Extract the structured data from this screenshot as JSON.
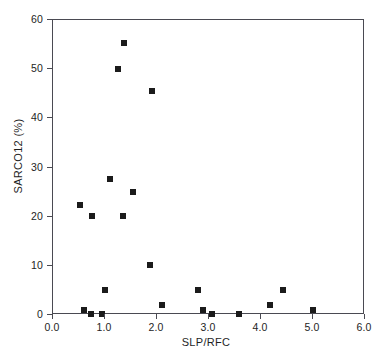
{
  "chart_data": {
    "type": "scatter",
    "title": "",
    "xlabel": "SLP/RFC",
    "ylabel": "SARCO12 (%)",
    "xlim": [
      0.0,
      6.0
    ],
    "ylim": [
      0,
      60
    ],
    "grid": false,
    "legend": null,
    "marker": {
      "shape": "square",
      "color": "#1b1b1b",
      "size_px": 6
    },
    "xticks": [
      "0.0",
      "1.0",
      "2.0",
      "3.0",
      "4.0",
      "5.0",
      "6.0"
    ],
    "xtick_values": [
      0.0,
      1.0,
      2.0,
      3.0,
      4.0,
      5.0,
      6.0
    ],
    "yticks": [
      "0",
      "10",
      "20",
      "30",
      "40",
      "50",
      "60"
    ],
    "ytick_values": [
      0,
      10,
      20,
      30,
      40,
      50,
      60
    ],
    "points": [
      {
        "x": 1.37,
        "y": 55.3
      },
      {
        "x": 1.25,
        "y": 50.0
      },
      {
        "x": 1.9,
        "y": 45.6
      },
      {
        "x": 1.1,
        "y": 27.6
      },
      {
        "x": 1.54,
        "y": 25.1
      },
      {
        "x": 0.52,
        "y": 22.4
      },
      {
        "x": 0.75,
        "y": 20.1
      },
      {
        "x": 1.35,
        "y": 20.1
      },
      {
        "x": 1.87,
        "y": 10.1
      },
      {
        "x": 1.0,
        "y": 5.0
      },
      {
        "x": 2.79,
        "y": 5.0
      },
      {
        "x": 4.42,
        "y": 5.0
      },
      {
        "x": 2.1,
        "y": 2.0
      },
      {
        "x": 4.17,
        "y": 2.0
      },
      {
        "x": 0.6,
        "y": 1.0
      },
      {
        "x": 2.88,
        "y": 1.0
      },
      {
        "x": 5.0,
        "y": 1.0
      },
      {
        "x": 0.73,
        "y": 0.2
      },
      {
        "x": 0.94,
        "y": 0.2
      },
      {
        "x": 3.06,
        "y": 0.2
      },
      {
        "x": 3.58,
        "y": 0.2
      }
    ]
  },
  "caption": {
    "label": "",
    "text": ""
  }
}
